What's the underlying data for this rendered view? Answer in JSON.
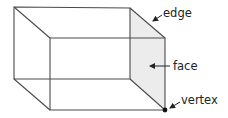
{
  "diagram": {
    "type": "cuboid-wireframe",
    "colors": {
      "line": "#4a4a4a",
      "face_fill": "#ececec",
      "text": "#222222",
      "vertex": "#111111"
    },
    "vertices": {
      "back_top_left": [
        14,
        7
      ],
      "back_top_right": [
        130,
        8
      ],
      "back_bottom_left": [
        14,
        79
      ],
      "back_bottom_right": [
        130,
        79
      ],
      "front_top_left": [
        50,
        38
      ],
      "front_top_right": [
        165,
        38
      ],
      "front_bottom_left": [
        50,
        110
      ],
      "front_bottom_right": [
        165,
        110
      ]
    },
    "labels": {
      "edge": "edge",
      "face": "face",
      "vertex": "vertex"
    }
  }
}
